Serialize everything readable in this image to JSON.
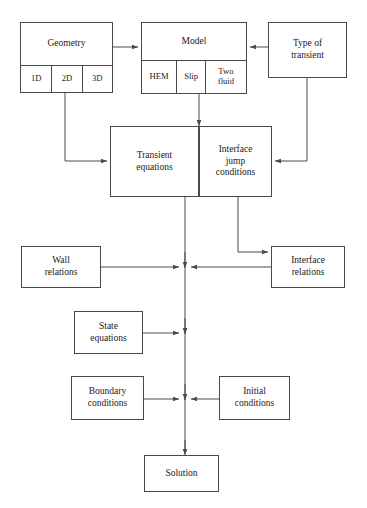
{
  "diagram": {
    "line_color": "#4a4a4a",
    "text_color": "#1a1a1a",
    "background": "#ffffff",
    "nodes": [
      {
        "id": "geometry",
        "label": "Geometry",
        "subcells": [
          "1D",
          "2D",
          "3D"
        ]
      },
      {
        "id": "model",
        "label": "Model",
        "subcells": [
          "HEM",
          "Slip",
          "Two\nfluid"
        ]
      },
      {
        "id": "type-of-transient",
        "label": "Type of\ntransient",
        "subcells": []
      },
      {
        "id": "transient-equations",
        "label": "Transient\nequations",
        "subcells": []
      },
      {
        "id": "interface-jump-conditions",
        "label": "Interface\njump\nconditions",
        "subcells": []
      },
      {
        "id": "wall-relations",
        "label": "Wall\nrelations",
        "subcells": []
      },
      {
        "id": "interface-relations",
        "label": "Interface\nrelations",
        "subcells": []
      },
      {
        "id": "state-equations",
        "label": "State\nequations",
        "subcells": []
      },
      {
        "id": "boundary-conditions",
        "label": "Boundary\nconditions",
        "subcells": []
      },
      {
        "id": "initial-conditions",
        "label": "Initial\nconditions",
        "subcells": []
      },
      {
        "id": "solution",
        "label": "Solution",
        "subcells": []
      }
    ],
    "edges": [
      {
        "from": "geometry",
        "to": "model",
        "arrow": true
      },
      {
        "from": "type-of-transient",
        "to": "model",
        "arrow": true
      },
      {
        "from": "geometry-2d",
        "to": "transient-equations",
        "arrow": true
      },
      {
        "from": "model-slip",
        "to": "transient-equations",
        "arrow": true
      },
      {
        "from": "type-of-transient",
        "to": "interface-jump-conditions",
        "arrow": true
      },
      {
        "from": "interface-jump-conditions",
        "to": "interface-relations",
        "arrow": true
      },
      {
        "from": "transient-equations",
        "to": "spine",
        "arrow": false
      },
      {
        "from": "wall-relations",
        "to": "spine",
        "arrow": true
      },
      {
        "from": "interface-relations",
        "to": "spine",
        "arrow": true
      },
      {
        "from": "state-equations",
        "to": "spine",
        "arrow": true
      },
      {
        "from": "boundary-conditions",
        "to": "spine",
        "arrow": true
      },
      {
        "from": "initial-conditions",
        "to": "spine",
        "arrow": true
      },
      {
        "from": "spine",
        "to": "solution",
        "arrow": true
      }
    ]
  }
}
